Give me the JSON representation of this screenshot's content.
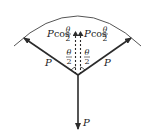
{
  "diagram": {
    "type": "force-diagram",
    "forces": {
      "left": {
        "label": "P"
      },
      "right": {
        "label": "P"
      },
      "down": {
        "label": "P"
      }
    },
    "components": {
      "left": {
        "prefix": "P",
        "func": "cos",
        "num": "θ",
        "den": "2"
      },
      "right": {
        "prefix": "P",
        "func": "cos",
        "num": "θ",
        "den": "2"
      }
    },
    "angles": {
      "left": {
        "num": "θ",
        "den": "2"
      },
      "right": {
        "num": "θ",
        "den": "2"
      }
    },
    "colors": {
      "line": "#2b2b2b",
      "arc": "#555555",
      "text": "#222222"
    }
  }
}
